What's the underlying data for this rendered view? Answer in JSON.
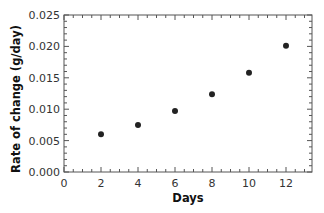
{
  "chart_data": {
    "type": "scatter",
    "title": "",
    "xlabel": "Days",
    "ylabel": "Rate of change (g/day)",
    "xlim": [
      0,
      13
    ],
    "ylim": [
      0.0,
      0.025
    ],
    "x_ticks": [
      0,
      2,
      4,
      6,
      8,
      10,
      12
    ],
    "x_tick_labels": [
      "0",
      "2",
      "4",
      "6",
      "8",
      "10",
      "12"
    ],
    "y_ticks": [
      0.0,
      0.005,
      0.01,
      0.015,
      0.02,
      0.025
    ],
    "y_tick_labels": [
      "0.000",
      "0.005",
      "0.010",
      "0.015",
      "0.020",
      "0.025"
    ],
    "x_minor_step": 0.5,
    "y_minor_step": 0.001,
    "grid": false,
    "legend": null,
    "series": [
      {
        "name": "Rate of change",
        "color": "#222222",
        "x": [
          2,
          4,
          6,
          8,
          10,
          12
        ],
        "y": [
          0.006,
          0.0075,
          0.0097,
          0.0124,
          0.0158,
          0.0201
        ]
      }
    ]
  }
}
